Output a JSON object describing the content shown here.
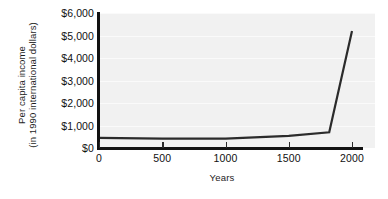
{
  "chart_data": {
    "type": "line",
    "title": "",
    "subtitle": "",
    "xlabel": "Years",
    "ylabel_line1": "Per capita income",
    "ylabel_line2": "(in 1990 international dollars)",
    "xlim": [
      0,
      2000
    ],
    "ylim": [
      0,
      6000
    ],
    "grid": true,
    "legend": "none",
    "x_ticks": [
      0,
      500,
      1000,
      1500,
      2000
    ],
    "x_ticklabels": [
      "0",
      "500",
      "1000",
      "1500",
      "2000"
    ],
    "y_ticks": [
      0,
      1000,
      2000,
      3000,
      4000,
      5000,
      6000
    ],
    "y_ticklabels": [
      "$0",
      "$1,000",
      "$2,000",
      "$3,000",
      "$4,000",
      "$5,000",
      "$6,000"
    ],
    "series": [
      {
        "name": "Per capita income",
        "color": "#2b2b2b",
        "x": [
          0,
          500,
          1000,
          1500,
          1820,
          2000
        ],
        "y": [
          450,
          420,
          415,
          540,
          700,
          5200
        ]
      }
    ]
  },
  "colors": {
    "plot_background": "#f1f1f1",
    "axis": "#121212",
    "line": "#2b2b2b",
    "text": "#111111",
    "page_background": "#ffffff"
  }
}
